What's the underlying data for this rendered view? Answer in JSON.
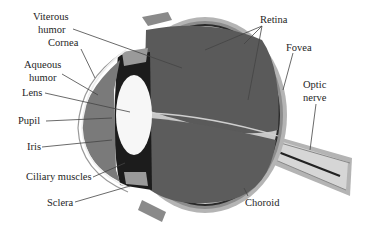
{
  "colors": {
    "background": "#ffffff",
    "vitreous": "#5a5a5a",
    "retina_layer": "#2a2a2a",
    "choroid_layer": "#8c8c8c",
    "sclera_outer": "#b4b4b4",
    "aqueous": "#7a7a7a",
    "lens": "#f7f7f7",
    "iris": "#1c1c1c",
    "leader_line": "#444444",
    "label_text": "#1e1e1e"
  },
  "labels": {
    "vitreous_1": "Viterous",
    "vitreous_2": "humor",
    "cornea": "Cornea",
    "aqueous_1": "Aqueous",
    "aqueous_2": "humor",
    "lens": "Lens",
    "pupil": "Pupil",
    "iris": "Iris",
    "ciliary": "Ciliary muscles",
    "sclera": "Sclera",
    "retina": "Retina",
    "fovea": "Fovea",
    "optic_1": "Optic",
    "optic_2": "nerve",
    "choroid": "Choroid"
  }
}
